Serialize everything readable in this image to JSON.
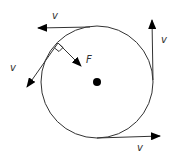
{
  "diagram": {
    "circle": {
      "cx": 97,
      "cy": 82,
      "r": 56,
      "stroke": "#333333"
    },
    "center_dot": {
      "cx": 97,
      "cy": 82,
      "r": 4,
      "fill": "#000000"
    },
    "colors": {
      "line": "#333333",
      "arrow": "#000000",
      "text": "#333333"
    },
    "labels": {
      "v_top": "v",
      "v_left": "v",
      "v_right": "v",
      "v_bottom": "v",
      "force": "F"
    },
    "right_angle_marker": true
  }
}
